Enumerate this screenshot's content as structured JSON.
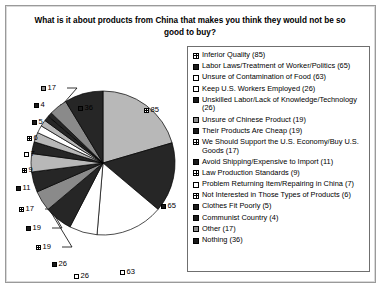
{
  "chart_data": {
    "type": "pie",
    "title": "What is it about products from China that makes you think they would not be so good to buy?",
    "xlabel": "",
    "ylabel": "",
    "legend_position": "right",
    "grid": false,
    "total": 376,
    "categories": [
      "Inferior Quality (85)",
      "Labor Laws/Treatment of Worker/Politics (65)",
      "Unsure of Contamination of Food (63)",
      "Keep U.S. Workers Employed (26)",
      "Unskilled Labor/Lack of Knowledge/Technology (26)",
      "Unsure of Chinese Product (19)",
      "Their Products Are Cheap (19)",
      "We Should Support the U.S. Economy/Buy U.S. Goods (17)",
      "Avoid Shipping/Expensive to Import (11)",
      "Law Production Standards (9)",
      "Problem Returning Item/Repairing in China (7)",
      "Not Interested in Those Types of Products (6)",
      "Clothes Fit Poorly (5)",
      "Communist Country (4)",
      "Other (17)",
      "Nothing (36)"
    ],
    "values": [
      85,
      65,
      63,
      26,
      26,
      19,
      19,
      17,
      11,
      9,
      7,
      6,
      5,
      4,
      17,
      36
    ],
    "slice_labels": [
      "85",
      "65",
      "63",
      "26",
      "26",
      "19",
      "19",
      "17",
      "11",
      "9",
      "7",
      "6",
      "5",
      "4",
      "17",
      "36"
    ]
  },
  "legend": {
    "items": [
      {
        "label": "Inferior Quality (85)",
        "marker": "grid"
      },
      {
        "label": "Labor Laws/Treatment of Worker/Politics (65)",
        "marker": "solid-dark"
      },
      {
        "label": "Unsure of Contamination of Food (63)",
        "marker": "open"
      },
      {
        "label": "Keep U.S. Workers Employed (26)",
        "marker": "open"
      },
      {
        "label": "Unskilled Labor/Lack of Knowledge/Technology (26)",
        "marker": "solid-dark"
      },
      {
        "label": "Unsure of Chinese Product (19)",
        "marker": "solid-mid"
      },
      {
        "label": "Their Products Are Cheap (19)",
        "marker": "solid-dark"
      },
      {
        "label": "We Should Support the U.S. Economy/Buy U.S. Goods (17)",
        "marker": "grid"
      },
      {
        "label": "Avoid Shipping/Expensive to Import (11)",
        "marker": "solid-dark"
      },
      {
        "label": "Law Production Standards (9)",
        "marker": "grid"
      },
      {
        "label": "Problem Returning Item/Repairing in China (7)",
        "marker": "open"
      },
      {
        "label": "Not Interested in Those Types of Products (6)",
        "marker": "grid"
      },
      {
        "label": "Clothes Fit Poorly (5)",
        "marker": "solid-dark"
      },
      {
        "label": "Communist Country (4)",
        "marker": "solid-dark"
      },
      {
        "label": "Other (17)",
        "marker": "solid-mid"
      },
      {
        "label": "Nothing (36)",
        "marker": "solid-dark"
      }
    ]
  },
  "slice_callouts": [
    {
      "text": "85",
      "marker": "grid",
      "left": 138,
      "top": 68
    },
    {
      "text": "36",
      "marker": "solid-dark",
      "left": 72,
      "top": 66
    },
    {
      "text": "17",
      "marker": "solid-mid",
      "left": 35,
      "top": 46
    },
    {
      "text": "4",
      "marker": "solid-dark",
      "left": 28,
      "top": 63
    },
    {
      "text": "5",
      "marker": "solid-dark",
      "left": 26,
      "top": 80
    },
    {
      "text": "6",
      "marker": "grid",
      "left": 21,
      "top": 96
    },
    {
      "text": "7",
      "marker": "open",
      "left": 18,
      "top": 112
    },
    {
      "text": "9",
      "marker": "grid",
      "left": 16,
      "top": 128
    },
    {
      "text": "11",
      "marker": "solid-dark",
      "left": 10,
      "top": 146
    },
    {
      "text": "17",
      "marker": "grid",
      "left": 13,
      "top": 167
    },
    {
      "text": "19",
      "marker": "solid-dark",
      "left": 20,
      "top": 186
    },
    {
      "text": "19",
      "marker": "grid",
      "left": 30,
      "top": 205
    },
    {
      "text": "26",
      "marker": "solid-dark",
      "left": 46,
      "top": 222
    },
    {
      "text": "26",
      "marker": "open",
      "left": 68,
      "top": 234
    },
    {
      "text": "63",
      "marker": "open",
      "left": 114,
      "top": 230
    },
    {
      "text": "65",
      "marker": "solid-dark",
      "left": 155,
      "top": 164
    }
  ]
}
